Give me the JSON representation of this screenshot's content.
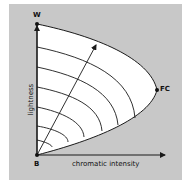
{
  "diagram": {
    "points": {
      "white": "W",
      "black": "B",
      "full_color": "FC"
    },
    "axes": {
      "x_label": "chromatic intensity",
      "y_label": "lightness"
    },
    "colors": {
      "background": "#c8c8c8",
      "gamut_fill": "#ffffff",
      "line": "#1a1a1a"
    },
    "contour_count": 6
  }
}
